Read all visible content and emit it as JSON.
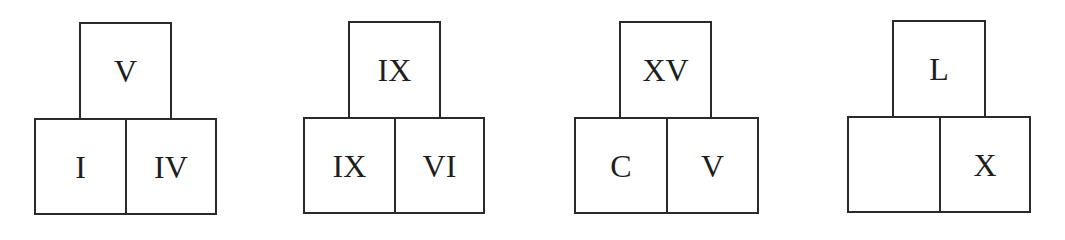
{
  "puzzle": {
    "groups": [
      {
        "top": "V",
        "bottom_left": "I",
        "bottom_right": "IV"
      },
      {
        "top": "IX",
        "bottom_left": "IX",
        "bottom_right": "VI"
      },
      {
        "top": "XV",
        "bottom_left": "C",
        "bottom_right": "V"
      },
      {
        "top": "L",
        "bottom_left": "",
        "bottom_right": "X"
      }
    ]
  }
}
